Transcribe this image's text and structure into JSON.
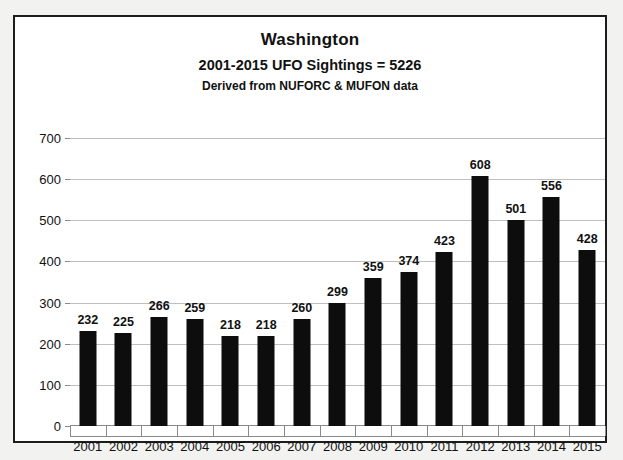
{
  "chart_data": {
    "type": "bar",
    "title": "Washington",
    "subtitle": "2001-2015 UFO Sightings = 5226",
    "source_note": "Derived from NUFORC & MUFON data",
    "xlabel": "",
    "ylabel": "",
    "ylim": [
      0,
      700
    ],
    "ytick_step": 100,
    "ytick_labels": [
      "700",
      "600",
      "500",
      "400",
      "300",
      "200",
      "100",
      "0"
    ],
    "ytick_values": [
      700,
      600,
      500,
      400,
      300,
      200,
      100,
      0
    ],
    "grid": true,
    "legend": "none",
    "bar_color": "#0d0d0d",
    "gridline_color": "#bfbfbf",
    "background_color": "#ffffff",
    "categories": [
      "2001",
      "2002",
      "2003",
      "2004",
      "2005",
      "2006",
      "2007",
      "2008",
      "2009",
      "2010",
      "2011",
      "2012",
      "2013",
      "2014",
      "2015"
    ],
    "values": [
      232,
      225,
      266,
      259,
      218,
      218,
      260,
      299,
      359,
      374,
      423,
      608,
      501,
      556,
      428
    ],
    "data_labels": [
      "232",
      "225",
      "266",
      "259",
      "218",
      "218",
      "260",
      "299",
      "359",
      "374",
      "423",
      "608",
      "501",
      "556",
      "428"
    ],
    "total": 5226
  }
}
